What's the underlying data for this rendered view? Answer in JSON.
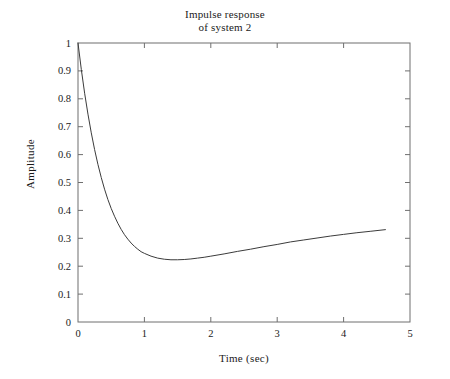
{
  "chart_data": {
    "type": "line",
    "title": "Impulse response of system 2",
    "title_lines": [
      "Impulse response",
      "of system 2"
    ],
    "xlabel": "Time (sec)",
    "ylabel": "Amplitude",
    "xlim": [
      0,
      5
    ],
    "ylim": [
      0,
      1
    ],
    "xticks": [
      0,
      1,
      2,
      3,
      4,
      5
    ],
    "xticklabels": [
      "0",
      "1",
      "2",
      "3",
      "4",
      "5"
    ],
    "yticks": [
      0,
      0.1,
      0.2,
      0.3,
      0.4,
      0.5,
      0.6,
      0.7,
      0.8,
      0.9,
      1
    ],
    "yticklabels": [
      "0",
      "0.1",
      "0.2",
      "0.3",
      "0.4",
      "0.5",
      "0.6",
      "0.7",
      "0.8",
      "0.9",
      "1"
    ],
    "grid": false,
    "legend": null,
    "box": true,
    "line_color": "#3b3b3b",
    "series": [
      {
        "name": "impulse response",
        "x": [
          0.0,
          0.05,
          0.1,
          0.15,
          0.2,
          0.25,
          0.3,
          0.35,
          0.4,
          0.45,
          0.5,
          0.55,
          0.6,
          0.65,
          0.7,
          0.75,
          0.8,
          0.85,
          0.9,
          0.95,
          1.0,
          1.1,
          1.2,
          1.3,
          1.4,
          1.5,
          1.6,
          1.7,
          1.8,
          1.9,
          2.0,
          2.2,
          2.4,
          2.6,
          2.8,
          3.0,
          3.2,
          3.4,
          3.6,
          3.8,
          4.0,
          4.2,
          4.4,
          4.63
        ],
        "y": [
          1.0,
          0.905,
          0.82,
          0.745,
          0.678,
          0.618,
          0.565,
          0.518,
          0.476,
          0.439,
          0.407,
          0.379,
          0.354,
          0.332,
          0.313,
          0.297,
          0.283,
          0.271,
          0.261,
          0.252,
          0.246,
          0.236,
          0.229,
          0.225,
          0.223,
          0.223,
          0.224,
          0.226,
          0.229,
          0.232,
          0.236,
          0.244,
          0.253,
          0.261,
          0.27,
          0.278,
          0.287,
          0.294,
          0.301,
          0.308,
          0.314,
          0.32,
          0.325,
          0.331
        ]
      }
    ]
  }
}
